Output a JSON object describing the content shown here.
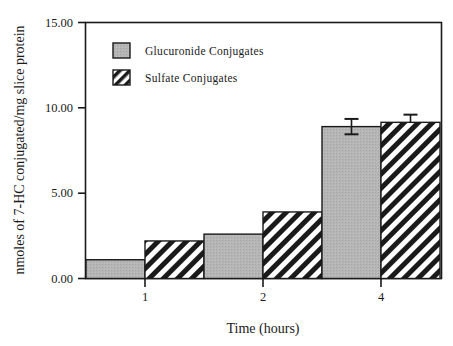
{
  "chart_data": {
    "type": "bar",
    "title": "",
    "xlabel": "Time (hours)",
    "ylabel": "nmoles of 7-HC conjugated/mg slice protein",
    "categories": [
      "1",
      "2",
      "4"
    ],
    "ylim": [
      0,
      15
    ],
    "yticks": [
      "0.00",
      "5.00",
      "10.00",
      "15.00"
    ],
    "ytick_values": [
      0,
      5,
      10,
      15
    ],
    "grid": false,
    "legend_position": "top-left-inside",
    "series": [
      {
        "name": "Glucuronide Conjugates",
        "fill": "solid-gray",
        "color": "#b5b5b5",
        "values": [
          1.1,
          2.6,
          8.9
        ],
        "errors": [
          0,
          0,
          0.45
        ]
      },
      {
        "name": "Sulfate Conjugates",
        "fill": "diagonal-hatch",
        "color": "#1a1a1a",
        "values": [
          2.2,
          3.9,
          9.15
        ],
        "errors": [
          0,
          0,
          0.45
        ]
      }
    ]
  },
  "axes": {
    "y_title": "nmoles of 7-HC conjugated/mg slice protein",
    "x_title": "Time (hours)",
    "y_tick_labels": [
      "15.00",
      "10.00",
      "5.00",
      "0.00"
    ],
    "x_tick_labels": [
      "1",
      "2",
      "4"
    ]
  },
  "legend": {
    "entries": [
      {
        "label": "Glucuronide Conjugates",
        "swatch": "gray-swatch"
      },
      {
        "label": "Sulfate Conjugates",
        "swatch": "hatch-swatch"
      }
    ]
  },
  "colors": {
    "bar_gray": "#b5b5b5",
    "bar_hatch": "#1a1a1a",
    "axis": "#1a1a1a",
    "background": "#ffffff"
  }
}
